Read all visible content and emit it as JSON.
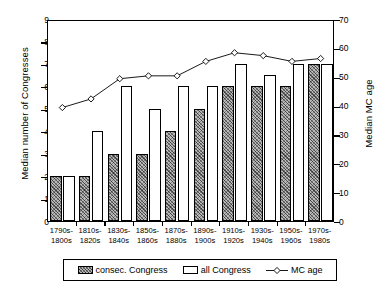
{
  "chart_data": {
    "type": "bar",
    "title": "",
    "xlabel": "",
    "ylabel": "Median number of Congresses",
    "y2label": "Median MC age",
    "ylim": [
      0,
      9
    ],
    "y2lim": [
      0,
      70
    ],
    "grid": false,
    "legend_position": "bottom",
    "categories": [
      "1790s-\n1800s",
      "1810s-\n1820s",
      "1830s-\n1840s",
      "1850s-\n1860s",
      "1870s-\n1880s",
      "1890s-\n1900s",
      "1910s-\n1920s",
      "1930s-\n1940s",
      "1950s-\n1960s",
      "1970s-\n1980s"
    ],
    "category_lines": [
      [
        "1790s-",
        "1800s"
      ],
      [
        "1810s-",
        "1820s"
      ],
      [
        "1830s-",
        "1840s"
      ],
      [
        "1850s-",
        "1860s"
      ],
      [
        "1870s-",
        "1880s"
      ],
      [
        "1890s-",
        "1900s"
      ],
      [
        "1910s-",
        "1920s"
      ],
      [
        "1930s-",
        "1940s"
      ],
      [
        "1950s-",
        "1960s"
      ],
      [
        "1970s-",
        "1980s"
      ]
    ],
    "yticks": [
      0,
      1,
      2,
      3,
      4,
      5,
      6,
      7,
      8,
      9
    ],
    "y2ticks": [
      0,
      10,
      20,
      30,
      40,
      50,
      60,
      70
    ],
    "series": [
      {
        "name": "consec. Congress",
        "axis": "left",
        "type": "bar",
        "style": "hatched",
        "values": [
          2,
          2,
          3,
          3,
          4,
          5,
          6,
          6,
          6,
          7
        ]
      },
      {
        "name": "all Congress",
        "axis": "left",
        "type": "bar",
        "style": "open",
        "values": [
          2,
          4,
          6,
          5,
          6,
          6,
          7,
          6.5,
          7,
          7
        ]
      },
      {
        "name": "MC age",
        "axis": "right",
        "type": "line",
        "marker": "diamond",
        "values": [
          40,
          43,
          50,
          51,
          51,
          56,
          59,
          58,
          56,
          57
        ]
      }
    ]
  },
  "legend": {
    "items": [
      {
        "label": "consec. Congress",
        "icon": "hatched-swatch"
      },
      {
        "label": "all Congress",
        "icon": "open-swatch"
      },
      {
        "label": "MC age",
        "icon": "diamond-line-marker"
      }
    ]
  }
}
